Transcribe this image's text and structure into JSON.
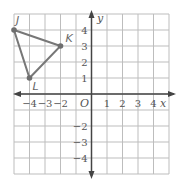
{
  "chart_data": {
    "type": "scatter",
    "title": "",
    "xlabel": "x",
    "ylabel": "y",
    "xlim": [
      -5,
      5
    ],
    "ylim": [
      -5,
      5
    ],
    "grid": true,
    "origin_label": "O",
    "x_ticks": [
      -4,
      -3,
      -2,
      1,
      2,
      3,
      4
    ],
    "x_tick_labels": [
      "−4",
      "−3",
      "−2",
      "1",
      "2",
      "3",
      "4"
    ],
    "y_ticks": [
      4,
      3,
      2,
      1,
      -2,
      -3,
      -4
    ],
    "y_tick_labels": [
      "4",
      "3",
      "2",
      "1",
      "−2",
      "−3",
      "−4"
    ],
    "points": [
      {
        "label": "J",
        "x": -5,
        "y": 4
      },
      {
        "label": "K",
        "x": -2,
        "y": 3
      },
      {
        "label": "L",
        "x": -4,
        "y": 1
      }
    ],
    "polygon": [
      "J",
      "K",
      "L"
    ],
    "colors": {
      "grid": "#bdbdbd",
      "axis": "#444444",
      "triangle": "#777777",
      "point": "#6e6e6e"
    }
  }
}
